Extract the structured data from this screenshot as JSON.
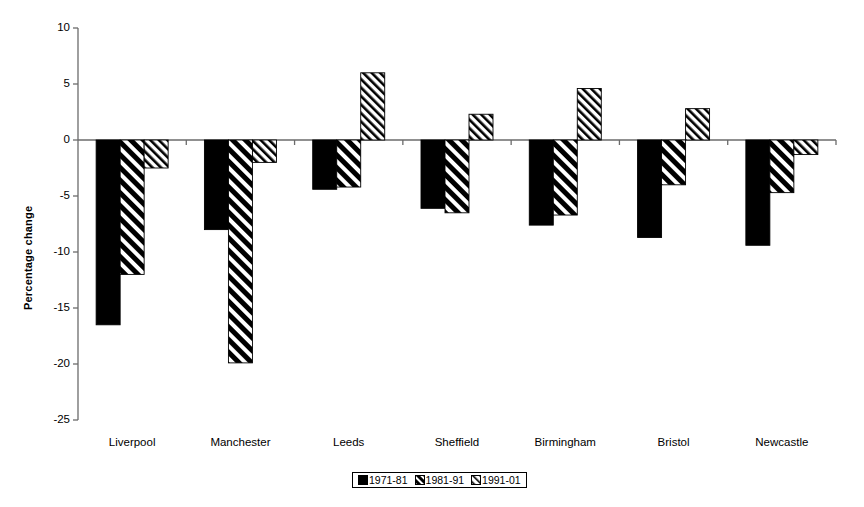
{
  "chart_data": {
    "type": "bar",
    "title": "",
    "subtitle": "",
    "xlabel": "",
    "ylabel": "Percentage change",
    "ylim": [
      -25,
      10
    ],
    "yticks": [
      10,
      5,
      0,
      -5,
      -10,
      -15,
      -20,
      -25
    ],
    "ytick_labels": [
      "10",
      "5",
      "0",
      "-5",
      "-10",
      "-15",
      "-20",
      "-25"
    ],
    "grid": false,
    "legend_position": "bottom-center",
    "categories": [
      "Liverpool",
      "Manchester",
      "Leeds",
      "Sheffield",
      "Birmingham",
      "Bristol",
      "Newcastle"
    ],
    "series": [
      {
        "name": "1971-81",
        "pattern": "solid-black",
        "color": "#000000",
        "values": [
          -16.5,
          -8.0,
          -4.4,
          -6.1,
          -7.6,
          -8.7,
          -9.4
        ]
      },
      {
        "name": "1981-91",
        "pattern": "thick-diagonal-hatch",
        "color": "#000000",
        "values": [
          -12.0,
          -19.9,
          -4.2,
          -6.5,
          -6.7,
          -4.0,
          -4.7
        ]
      },
      {
        "name": "1991-01",
        "pattern": "fine-diagonal-hatch",
        "color": "#000000",
        "values": [
          -2.5,
          -2.0,
          6.0,
          2.3,
          4.6,
          2.8,
          -1.3
        ]
      }
    ]
  },
  "axis": {
    "y_title": "Percentage change"
  },
  "legend": {
    "items": [
      {
        "label": "1971-81"
      },
      {
        "label": "1981-91"
      },
      {
        "label": "1991-01"
      }
    ]
  },
  "colors": {
    "ink": "#000000",
    "axis": "#6b6b6b",
    "background": "#ffffff"
  }
}
